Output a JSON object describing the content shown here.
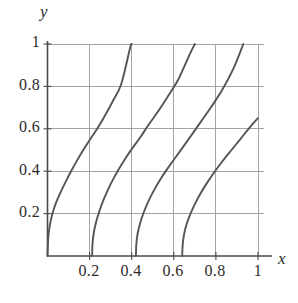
{
  "figure": {
    "kind": "line-plot",
    "background": "#ffffff",
    "ink_color": "#555555",
    "grid_color": "#9a9a9a",
    "axis_color": "#4a4a4a"
  },
  "axes": {
    "x_label": "x",
    "y_label": "y",
    "x_ticks": [
      "0.2",
      "0.4",
      "0.6",
      "0.8",
      "1"
    ],
    "y_ticks": [
      "0.2",
      "0.4",
      "0.6",
      "0.8",
      "1"
    ]
  },
  "chart_data": {
    "type": "line",
    "title": "",
    "xlabel": "x",
    "ylabel": "y",
    "xlim": [
      0,
      1
    ],
    "ylim": [
      0,
      1
    ],
    "xticks": [
      0.2,
      0.4,
      0.6,
      0.8,
      1
    ],
    "yticks": [
      0.2,
      0.4,
      0.6,
      0.8,
      1
    ],
    "grid": true,
    "legend": "none",
    "series": [
      {
        "name": "curve-1",
        "x": [
          0.0,
          0.004,
          0.012,
          0.025,
          0.042,
          0.062,
          0.086,
          0.112,
          0.14,
          0.17,
          0.202,
          0.236,
          0.272,
          0.31,
          0.35,
          0.392,
          0.4
        ],
        "y": [
          0.0,
          0.09,
          0.15,
          0.205,
          0.255,
          0.3,
          0.35,
          0.4,
          0.45,
          0.5,
          0.55,
          0.6,
          0.66,
          0.73,
          0.81,
          0.98,
          1.0
        ]
      },
      {
        "name": "curve-2",
        "x": [
          0.212,
          0.214,
          0.22,
          0.231,
          0.246,
          0.264,
          0.286,
          0.311,
          0.339,
          0.37,
          0.404,
          0.441,
          0.481,
          0.524,
          0.57,
          0.62,
          0.675,
          0.7
        ],
        "y": [
          0.0,
          0.06,
          0.11,
          0.16,
          0.21,
          0.26,
          0.31,
          0.36,
          0.41,
          0.46,
          0.51,
          0.56,
          0.62,
          0.68,
          0.75,
          0.83,
          0.95,
          1.0
        ]
      },
      {
        "name": "curve-3",
        "x": [
          0.42,
          0.422,
          0.428,
          0.44,
          0.457,
          0.478,
          0.503,
          0.532,
          0.565,
          0.601,
          0.641,
          0.684,
          0.73,
          0.779,
          0.831,
          0.886,
          0.93
        ],
        "y": [
          0.0,
          0.055,
          0.105,
          0.155,
          0.205,
          0.255,
          0.305,
          0.355,
          0.405,
          0.455,
          0.51,
          0.57,
          0.635,
          0.705,
          0.785,
          0.89,
          1.0
        ]
      },
      {
        "name": "curve-4",
        "x": [
          0.64,
          0.642,
          0.648,
          0.66,
          0.678,
          0.7,
          0.727,
          0.758,
          0.793,
          0.832,
          0.874,
          0.919,
          0.966,
          1.0
        ],
        "y": [
          0.0,
          0.05,
          0.098,
          0.147,
          0.196,
          0.245,
          0.295,
          0.345,
          0.396,
          0.448,
          0.5,
          0.555,
          0.613,
          0.65
        ]
      }
    ]
  }
}
